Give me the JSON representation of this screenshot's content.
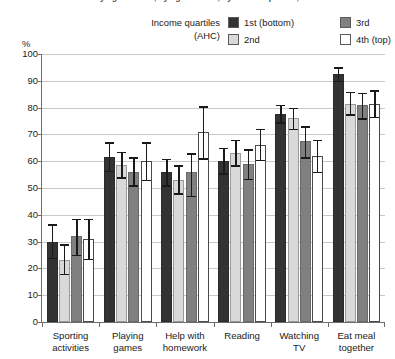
{
  "title_sliver": "Activities with mother by age of child, by age of child, by income quartile, 2010–11",
  "axis": {
    "y_unit_label": "%",
    "y_ticks": [
      "0",
      "10",
      "20",
      "30",
      "40",
      "50",
      "60",
      "70",
      "80",
      "90",
      "100"
    ]
  },
  "legend": {
    "title_line1": "Income quartiles",
    "title_line2": "(AHC)",
    "items": [
      {
        "label": "1st (bottom)",
        "color": "#333333"
      },
      {
        "label": "2nd",
        "color": "#d9d9d9"
      },
      {
        "label": "3rd",
        "color": "#808080"
      },
      {
        "label": "4th (top)",
        "color": "#ffffff"
      }
    ]
  },
  "chart_data": {
    "type": "bar",
    "title": "Activities with mother by age of child, by age of child, by income quartile, 2010–11",
    "xlabel": "",
    "ylabel": "%",
    "ylim": [
      0,
      100
    ],
    "ytick_step": 10,
    "grid": true,
    "legend_position": "top",
    "error_bars": "95% confidence interval",
    "categories": [
      "Sporting activities",
      "Playing games",
      "Help with homework",
      "Reading",
      "Watching TV",
      "Eat meal together"
    ],
    "category_lines": [
      [
        "Sporting",
        "activities"
      ],
      [
        "Playing",
        "games"
      ],
      [
        "Help with",
        "homework"
      ],
      [
        "Reading",
        ""
      ],
      [
        "Watching",
        "TV"
      ],
      [
        "Eat meal",
        "together"
      ]
    ],
    "series": [
      {
        "name": "1st (bottom)",
        "color": "#333333",
        "values": [
          30,
          61.5,
          56,
          60,
          77.5,
          92.5
        ],
        "err_low": [
          23.5,
          56,
          50.5,
          55,
          74,
          89.5
        ],
        "err_high": [
          36.5,
          67,
          61,
          65,
          81,
          95
        ]
      },
      {
        "name": "2nd",
        "color": "#d9d9d9",
        "values": [
          23,
          58.5,
          53,
          63,
          76,
          81.5
        ],
        "err_low": [
          17.5,
          53.5,
          47.5,
          58,
          71.5,
          77
        ],
        "err_high": [
          29,
          63.5,
          58.5,
          68,
          80,
          86
        ]
      },
      {
        "name": "3rd",
        "color": "#808080",
        "values": [
          32,
          56,
          56,
          59,
          67.5,
          81
        ],
        "err_low": [
          24.5,
          50.5,
          46.5,
          53,
          61,
          75.5
        ],
        "err_high": [
          38.5,
          61.5,
          63,
          64.5,
          73,
          85.5
        ]
      },
      {
        "name": "4th (top)",
        "color": "#ffffff",
        "values": [
          31,
          60,
          71,
          66,
          62,
          81.5
        ],
        "err_low": [
          23,
          52.5,
          60.5,
          60,
          55.5,
          76
        ],
        "err_high": [
          38.5,
          67,
          80.5,
          72,
          68,
          86.5
        ]
      }
    ]
  }
}
